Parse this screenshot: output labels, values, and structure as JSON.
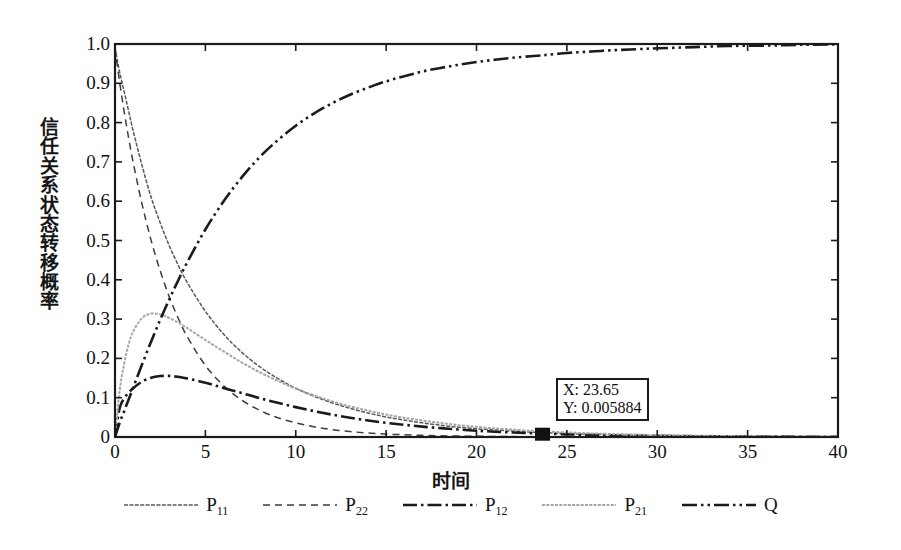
{
  "figure": {
    "background": "#ffffff",
    "axis_color": "#1b1b1b"
  },
  "axes": {
    "xlabel": "时间",
    "ylabel_chars": [
      "信",
      "任",
      "关",
      "系",
      "状",
      "态",
      "转",
      "移",
      "概",
      "率"
    ],
    "ylabel": "信任关系状态转移概率",
    "xticks": [
      "0",
      "5",
      "10",
      "15",
      "20",
      "25",
      "30",
      "35",
      "40"
    ],
    "yticks": [
      "0",
      "0.1",
      "0.2",
      "0.3",
      "0.4",
      "0.5",
      "0.6",
      "0.7",
      "0.8",
      "0.9",
      "1.0"
    ]
  },
  "datatip": {
    "x_line": "X: 23.65",
    "y_line": "Y: 0.005884",
    "x_value": 23.65,
    "y_value": 0.005884
  },
  "legend": {
    "items": [
      {
        "label": "P",
        "sub": "11",
        "style": "fine-gray-solid",
        "color": "#4a4a4a"
      },
      {
        "label": "P",
        "sub": "22",
        "style": "dashed",
        "color": "#3a3a3a"
      },
      {
        "label": "P",
        "sub": "12",
        "style": "dash-dot",
        "color": "#151515"
      },
      {
        "label": "P",
        "sub": "21",
        "style": "light-dotted",
        "color": "#9a9a9a"
      },
      {
        "label": "Q",
        "sub": "",
        "style": "dash-dot-dot",
        "color": "#151515"
      }
    ]
  },
  "chart_data": {
    "type": "line",
    "title": "",
    "xlabel": "时间",
    "ylabel": "信任关系状态转移概率",
    "xlim": [
      0,
      40
    ],
    "ylim": [
      0,
      1.0
    ],
    "xticks": [
      0,
      5,
      10,
      15,
      20,
      25,
      30,
      35,
      40
    ],
    "yticks": [
      0,
      0.1,
      0.2,
      0.3,
      0.4,
      0.5,
      0.6,
      0.7,
      0.8,
      0.9,
      1.0
    ],
    "grid": false,
    "legend_position": "below-axes",
    "annotations": [
      {
        "type": "datatip",
        "x": 23.65,
        "y": 0.005884,
        "text": "X: 23.65\nY: 0.005884",
        "marker": "filled-square"
      }
    ],
    "x": [
      0,
      0.25,
      0.5,
      0.75,
      1,
      1.5,
      2,
      2.5,
      3,
      3.5,
      4,
      5,
      6,
      7,
      8,
      9,
      10,
      11,
      12,
      13,
      14,
      15,
      16,
      17,
      18,
      19,
      20,
      21,
      22,
      23,
      23.65,
      24,
      25,
      26,
      27,
      28,
      29,
      30,
      32,
      34,
      36,
      38,
      40
    ],
    "series": [
      {
        "name": "P11",
        "style": "fine-gray-solid",
        "values": [
          0.99,
          0.93,
          0.88,
          0.83,
          0.78,
          0.69,
          0.61,
          0.545,
          0.487,
          0.437,
          0.393,
          0.32,
          0.262,
          0.216,
          0.179,
          0.149,
          0.124,
          0.104,
          0.087,
          0.073,
          0.061,
          0.051,
          0.043,
          0.036,
          0.03,
          0.025,
          0.021,
          0.018,
          0.015,
          0.0125,
          0.0115,
          0.0105,
          0.0088,
          0.0074,
          0.0062,
          0.0052,
          0.0044,
          0.0037,
          0.0026,
          0.0018,
          0.0013,
          0.0009,
          0.0006
        ]
      },
      {
        "name": "P22",
        "style": "dashed",
        "values": [
          0.99,
          0.905,
          0.83,
          0.762,
          0.7,
          0.592,
          0.5,
          0.423,
          0.357,
          0.302,
          0.255,
          0.182,
          0.131,
          0.094,
          0.068,
          0.049,
          0.036,
          0.026,
          0.019,
          0.014,
          0.01,
          0.0075,
          0.0056,
          0.0042,
          0.0031,
          0.0024,
          0.0018,
          0.0013,
          0.001,
          0.0008,
          0.0007,
          0.0006,
          0.0005,
          0.0004,
          0.0003,
          0.0002,
          0.0002,
          0.0001,
          0.0001,
          0.0001,
          0.0,
          0.0,
          0.0
        ]
      },
      {
        "name": "P12",
        "style": "dash-dot",
        "values": [
          0.0,
          0.072,
          0.098,
          0.112,
          0.124,
          0.141,
          0.151,
          0.155,
          0.1555,
          0.153,
          0.149,
          0.138,
          0.125,
          0.112,
          0.099,
          0.087,
          0.076,
          0.066,
          0.057,
          0.049,
          0.042,
          0.036,
          0.031,
          0.0265,
          0.0225,
          0.019,
          0.016,
          0.0135,
          0.0114,
          0.0096,
          0.0089,
          0.0081,
          0.0068,
          0.0057,
          0.0048,
          0.004,
          0.0034,
          0.0028,
          0.002,
          0.0014,
          0.001,
          0.0007,
          0.0005
        ]
      },
      {
        "name": "P21",
        "style": "light-dotted",
        "values": [
          0.0,
          0.115,
          0.185,
          0.235,
          0.268,
          0.303,
          0.314,
          0.312,
          0.303,
          0.291,
          0.277,
          0.247,
          0.218,
          0.19,
          0.165,
          0.143,
          0.123,
          0.106,
          0.091,
          0.078,
          0.067,
          0.057,
          0.049,
          0.042,
          0.036,
          0.03,
          0.026,
          0.022,
          0.019,
          0.016,
          0.0148,
          0.0135,
          0.0115,
          0.0097,
          0.0082,
          0.0069,
          0.0058,
          0.0049,
          0.0035,
          0.0025,
          0.0017,
          0.0012,
          0.0009
        ]
      },
      {
        "name": "Q",
        "style": "dash-dot-dot",
        "values": [
          0.0,
          0.035,
          0.065,
          0.095,
          0.125,
          0.185,
          0.243,
          0.298,
          0.35,
          0.399,
          0.445,
          0.528,
          0.599,
          0.66,
          0.712,
          0.755,
          0.792,
          0.823,
          0.849,
          0.871,
          0.889,
          0.905,
          0.918,
          0.93,
          0.939,
          0.947,
          0.954,
          0.96,
          0.965,
          0.969,
          0.971,
          0.973,
          0.977,
          0.98,
          0.983,
          0.985,
          0.987,
          0.989,
          0.992,
          0.995,
          0.996,
          0.998,
          0.999
        ]
      }
    ]
  }
}
